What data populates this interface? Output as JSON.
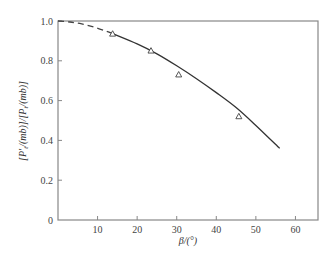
{
  "chart_data": {
    "type": "line",
    "title": "",
    "xlabel": "β/(°)",
    "ylabel": "[P′t/(mb)]/[Pt/(mb)]",
    "xlim": [
      0,
      65.7
    ],
    "ylim": [
      0,
      1.0
    ],
    "xticks": [
      10,
      20,
      30,
      40,
      50,
      60
    ],
    "yticks": [
      0,
      0.2,
      0.4,
      0.6,
      0.8,
      1.0
    ],
    "ytick_labels": [
      "0",
      "0.2",
      "0.4",
      "0.6",
      "0.8",
      "1.0"
    ],
    "xtick_labels": [
      "10",
      "20",
      "30",
      "40",
      "50",
      "60"
    ],
    "grid": false,
    "frame": "box",
    "series": [
      {
        "name": "fitted curve (dashed extrapolation)",
        "style": "dashed",
        "x": [
          0,
          3,
          6,
          9,
          12,
          14
        ],
        "y": [
          1.0,
          0.995,
          0.985,
          0.97,
          0.95,
          0.935
        ]
      },
      {
        "name": "fitted curve",
        "style": "solid",
        "x": [
          14,
          20,
          25,
          30,
          35,
          40,
          45,
          50,
          56
        ],
        "y": [
          0.935,
          0.885,
          0.835,
          0.775,
          0.71,
          0.64,
          0.565,
          0.475,
          0.36
        ]
      },
      {
        "name": "measured",
        "style": "markers",
        "marker": "triangle-open",
        "x": [
          13.8,
          23.5,
          30.5,
          45.7
        ],
        "y": [
          0.935,
          0.85,
          0.73,
          0.52
        ]
      }
    ]
  },
  "labels": {
    "x_axis": "β/(°)",
    "y_axis_parts": [
      "[P′",
      "t",
      "/(mb)]/[P",
      "t",
      "/(mb)]"
    ]
  }
}
